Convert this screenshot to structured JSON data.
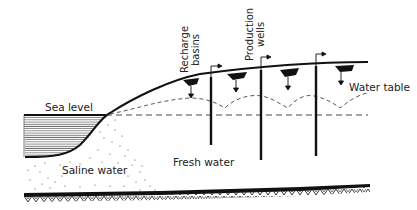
{
  "diagram": {
    "labels": {
      "sea_level": "Sea level",
      "recharge_basins_line1": "Recharge",
      "recharge_basins_line2": "basins",
      "production_wells_line1": "Production",
      "production_wells_line2": "wells",
      "water_table": "Water table",
      "saline_water": "Saline water",
      "fresh_water": "Fresh water"
    },
    "colors": {
      "ink": "#111111",
      "background": "#ffffff"
    },
    "elements": {
      "recharge_basins_count": 4,
      "production_wells_count": 3
    }
  }
}
